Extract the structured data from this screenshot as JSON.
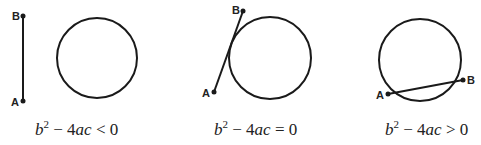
{
  "panels": [
    {
      "id": "no-intersection",
      "equation": {
        "b": "b",
        "exp": "2",
        "rest_minus": " − 4",
        "ac": "ac",
        "rel": " < 0"
      },
      "point_a": "A",
      "point_b": "B",
      "circle": {
        "cx": 97,
        "cy": 58,
        "r": 40
      },
      "segment": {
        "ax": 23,
        "ay": 101,
        "bx": 23,
        "by": 16
      },
      "equation_x": 72
    },
    {
      "id": "tangent",
      "equation": {
        "b": "b",
        "exp": "2",
        "rest_minus": " − 4",
        "ac": "ac",
        "rel": " = 0"
      },
      "point_a": "A",
      "point_b": "B",
      "circle": {
        "cx": 270,
        "cy": 58,
        "r": 42
      },
      "segment": {
        "ax": 214,
        "ay": 92,
        "bx": 243,
        "by": 11
      },
      "equation_x": 215
    },
    {
      "id": "secant",
      "equation": {
        "b": "b",
        "exp": "2",
        "rest_minus": " − 4",
        "ac": "ac",
        "rel": " > 0"
      },
      "point_a": "A",
      "point_b": "B",
      "circle": {
        "cx": 420,
        "cy": 60,
        "r": 41
      },
      "segment": {
        "ax": 388,
        "ay": 94,
        "bx": 463,
        "by": 80
      },
      "equation_x": 385
    }
  ],
  "colors": {
    "stroke": "#1a1a1a",
    "background": "#ffffff"
  }
}
